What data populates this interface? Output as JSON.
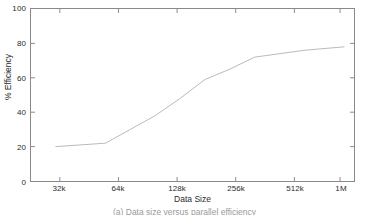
{
  "figure": {
    "caption": "(a) Data size versus parallel efficiency"
  },
  "axis": {
    "x_title": "Data Size",
    "y_title": "% Efficiency"
  },
  "colors": {
    "line": "#b9b9b9",
    "axis": "#8a8a8a",
    "text": "#2b2b2b",
    "background": "#ffffff"
  },
  "chart_data": {
    "type": "line",
    "title": "",
    "xlabel": "Data Size",
    "ylabel": "% Efficiency",
    "categories": [
      "32k",
      "64k",
      "128k",
      "256k",
      "512k",
      "1M"
    ],
    "x_tick_labels": [
      "32k",
      "64k",
      "128k",
      "256k",
      "512k",
      "1M"
    ],
    "y_tick_labels": [
      "0",
      "20",
      "40",
      "60",
      "80",
      "100"
    ],
    "y_ticks": [
      0,
      20,
      40,
      60,
      80,
      100
    ],
    "ylim": [
      0,
      100
    ],
    "xlim": [
      0,
      6.5
    ],
    "grid": false,
    "legend": null,
    "series": [
      {
        "name": "% Efficiency",
        "values": [
          20,
          22,
          38,
          59,
          72,
          78
        ],
        "points": [
          {
            "x": "32k",
            "x_pos": 0.5,
            "y": 20
          },
          {
            "x": "64k",
            "x_pos": 1.5,
            "y": 22
          },
          {
            "x": "96k",
            "x_pos": 2.0,
            "y": 30
          },
          {
            "x": "128k",
            "x_pos": 2.5,
            "y": 38
          },
          {
            "x": "192k",
            "x_pos": 3.0,
            "y": 48
          },
          {
            "x": "256k",
            "x_pos": 3.5,
            "y": 59
          },
          {
            "x": "384k",
            "x_pos": 4.0,
            "y": 65
          },
          {
            "x": "512k",
            "x_pos": 4.5,
            "y": 72
          },
          {
            "x": "768k",
            "x_pos": 5.5,
            "y": 76
          },
          {
            "x": "1M",
            "x_pos": 6.3,
            "y": 78
          }
        ]
      }
    ]
  }
}
